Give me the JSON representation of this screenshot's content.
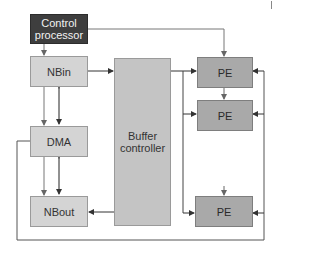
{
  "diagram": {
    "type": "block-diagram",
    "colors": {
      "control_processor": "#3e3e3e",
      "memory_blocks": "#d4d4d4",
      "buffer_controller": "#c4c4c4",
      "pe": "#a9a9a9",
      "lines": "#555555"
    },
    "nodes": {
      "control_processor": {
        "label_line1": "Control",
        "label_line2": "processor"
      },
      "nbin": {
        "label": "NBin"
      },
      "dma": {
        "label": "DMA"
      },
      "nbout": {
        "label": "NBout"
      },
      "buffer_controller": {
        "label_line1": "Buffer",
        "label_line2": "controller"
      },
      "pe_1": {
        "label": "PE"
      },
      "pe_2": {
        "label": "PE"
      },
      "pe_3": {
        "label": "PE"
      }
    },
    "edges": [
      {
        "from": "control_processor",
        "to": "nbin"
      },
      {
        "from": "control_processor",
        "to": "pe_1"
      },
      {
        "from": "nbin",
        "to": "buffer_controller"
      },
      {
        "from": "nbin",
        "to": "dma"
      },
      {
        "from": "dma",
        "to": "nbin"
      },
      {
        "from": "dma",
        "to": "nbout"
      },
      {
        "from": "nbout",
        "to": "dma"
      },
      {
        "from": "buffer_controller",
        "to": "nbout"
      },
      {
        "from": "buffer_controller",
        "to": "pe_1"
      },
      {
        "from": "buffer_controller",
        "to": "pe_2"
      },
      {
        "from": "buffer_controller",
        "to": "pe_3"
      },
      {
        "from": "pe_1",
        "to": "pe_2"
      },
      {
        "from": "dma",
        "to": "pe_all",
        "via": "feedback-loop"
      }
    ]
  }
}
